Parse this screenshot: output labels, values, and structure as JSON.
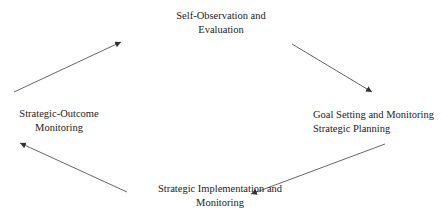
{
  "diagram": {
    "type": "cycle",
    "nodes": [
      {
        "id": "self-observation",
        "lines": [
          "Self-Observation and",
          "Evaluation"
        ]
      },
      {
        "id": "goal-setting",
        "lines": [
          "Goal Setting and Monitoring",
          "Strategic Planning"
        ]
      },
      {
        "id": "strategic-implementation",
        "lines": [
          "Strategic Implementation and",
          "Monitoring"
        ]
      },
      {
        "id": "strategic-outcome",
        "lines": [
          "Strategic-Outcome",
          "Monitoring"
        ]
      }
    ],
    "edges": [
      {
        "from": "self-observation",
        "to": "goal-setting"
      },
      {
        "from": "goal-setting",
        "to": "strategic-implementation"
      },
      {
        "from": "strategic-implementation",
        "to": "strategic-outcome"
      },
      {
        "from": "strategic-outcome",
        "to": "self-observation"
      }
    ],
    "colors": {
      "text": "#222222",
      "arrow": "#555555",
      "background": "#ffffff"
    }
  }
}
